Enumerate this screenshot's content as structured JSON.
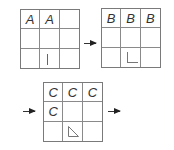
{
  "diagram": {
    "grids": [
      {
        "id": "grid-1",
        "cells": [
          "A",
          "A",
          "",
          "",
          "",
          "",
          "",
          "",
          ""
        ],
        "mark": {
          "cell": 7,
          "shape": "vertical-bar"
        }
      },
      {
        "id": "grid-2",
        "cells": [
          "B",
          "B",
          "B",
          "",
          "",
          "",
          "",
          "",
          ""
        ],
        "mark": {
          "cell": 7,
          "shape": "L-corner"
        }
      },
      {
        "id": "grid-3",
        "cells": [
          "C",
          "C",
          "C",
          "C",
          "",
          "",
          "",
          "",
          ""
        ],
        "mark": {
          "cell": 7,
          "shape": "right-triangle"
        }
      }
    ],
    "arrows": [
      {
        "from": "grid-1",
        "to": "grid-2"
      },
      {
        "into": "grid-3"
      },
      {
        "from": "grid-3",
        "to": "next"
      }
    ]
  }
}
